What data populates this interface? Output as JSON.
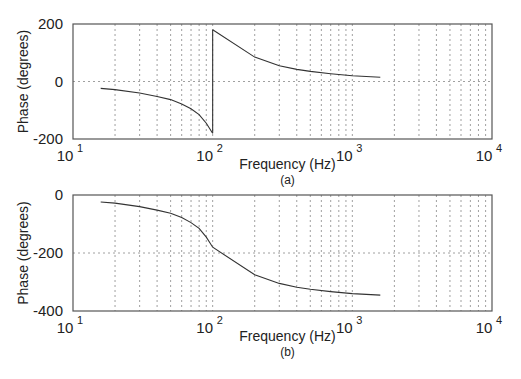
{
  "figure": {
    "panels": [
      {
        "id": "a",
        "ylabel": "Phase (degrees)",
        "xlabel": "Frequency (Hz)",
        "sublabel": "(a)",
        "yticks": [
          "200",
          "0",
          "-200"
        ],
        "xticks": [
          {
            "base": "10",
            "exp": "1"
          },
          {
            "base": "10",
            "exp": "2"
          },
          {
            "base": "10",
            "exp": "3"
          },
          {
            "base": "10",
            "exp": "4"
          }
        ]
      },
      {
        "id": "b",
        "ylabel": "Phase (degrees)",
        "xlabel": "Frequency (Hz)",
        "sublabel": "(b)",
        "yticks": [
          "0",
          "-200",
          "-400"
        ],
        "xticks": [
          {
            "base": "10",
            "exp": "1"
          },
          {
            "base": "10",
            "exp": "2"
          },
          {
            "base": "10",
            "exp": "3"
          },
          {
            "base": "10",
            "exp": "4"
          }
        ]
      }
    ]
  },
  "chart_data": [
    {
      "type": "line",
      "title": "(a)",
      "xlabel": "Frequency (Hz)",
      "ylabel": "Phase (degrees)",
      "xscale": "log",
      "xlim": [
        10,
        10000
      ],
      "ylim": [
        -200,
        200
      ],
      "grid": true,
      "series": [
        {
          "name": "wrapped phase (below 100 Hz)",
          "x": [
            15.8,
            20,
            30,
            40,
            50,
            60,
            70,
            80,
            90,
            99.9
          ],
          "y": [
            -24,
            -28,
            -40,
            -52,
            -63,
            -78,
            -95,
            -115,
            -145,
            -180
          ]
        },
        {
          "name": "wrapped phase (above 100 Hz)",
          "x": [
            100.1,
            200,
            300,
            400,
            500,
            700,
            1000,
            1585
          ],
          "y": [
            180,
            85,
            55,
            42,
            35,
            27,
            20,
            15
          ]
        }
      ]
    },
    {
      "type": "line",
      "title": "(b)",
      "xlabel": "Frequency (Hz)",
      "ylabel": "Phase (degrees)",
      "xscale": "log",
      "xlim": [
        10,
        10000
      ],
      "ylim": [
        -400,
        0
      ],
      "grid": true,
      "series": [
        {
          "name": "unwrapped phase",
          "x": [
            15.8,
            20,
            30,
            40,
            50,
            60,
            70,
            80,
            90,
            100,
            200,
            300,
            400,
            500,
            700,
            1000,
            1585
          ],
          "y": [
            -24,
            -28,
            -40,
            -52,
            -63,
            -78,
            -95,
            -115,
            -145,
            -180,
            -275,
            -305,
            -318,
            -325,
            -333,
            -340,
            -345
          ]
        }
      ]
    }
  ]
}
